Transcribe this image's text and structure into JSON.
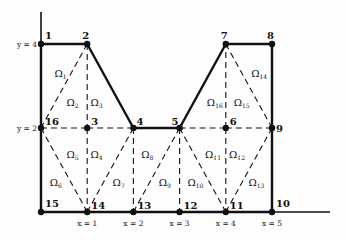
{
  "diagram": {
    "type": "finite-element-mesh",
    "scale": {
      "x0_px": 41,
      "x_unit_px": 46.2,
      "y0_px": 212,
      "y_unit_px": 42
    },
    "axes": {
      "x_ticks": [
        {
          "x": 1,
          "label": "x = 1"
        },
        {
          "x": 2,
          "label": "x = 2"
        },
        {
          "x": 3,
          "label": "x = 3"
        },
        {
          "x": 4,
          "label": "x = 4"
        },
        {
          "x": 5,
          "label": "x = 5"
        }
      ],
      "y_ticks": [
        {
          "y": 4,
          "label": "y = 4"
        },
        {
          "y": 2,
          "label": "y = 2"
        }
      ]
    },
    "nodes": [
      {
        "id": "1",
        "x": 0,
        "y": 4
      },
      {
        "id": "2",
        "x": 1,
        "y": 4
      },
      {
        "id": "3",
        "x": 1,
        "y": 2
      },
      {
        "id": "4",
        "x": 2,
        "y": 2
      },
      {
        "id": "5",
        "x": 3,
        "y": 2
      },
      {
        "id": "6",
        "x": 4,
        "y": 2
      },
      {
        "id": "7",
        "x": 4,
        "y": 4
      },
      {
        "id": "8",
        "x": 5,
        "y": 4
      },
      {
        "id": "9",
        "x": 5,
        "y": 2
      },
      {
        "id": "10",
        "x": 5,
        "y": 0
      },
      {
        "id": "11",
        "x": 4,
        "y": 0
      },
      {
        "id": "12",
        "x": 3,
        "y": 0
      },
      {
        "id": "13",
        "x": 2,
        "y": 0
      },
      {
        "id": "14",
        "x": 1,
        "y": 0
      },
      {
        "id": "15",
        "x": 0,
        "y": 0
      },
      {
        "id": "16",
        "x": 0,
        "y": 2
      }
    ],
    "boundary_edges": [
      [
        "1",
        "2"
      ],
      [
        "2",
        "4"
      ],
      [
        "4",
        "5"
      ],
      [
        "5",
        "7"
      ],
      [
        "7",
        "8"
      ],
      [
        "8",
        "9"
      ],
      [
        "9",
        "10"
      ],
      [
        "10",
        "11"
      ],
      [
        "11",
        "12"
      ],
      [
        "12",
        "13"
      ],
      [
        "13",
        "14"
      ],
      [
        "14",
        "15"
      ],
      [
        "15",
        "16"
      ],
      [
        "16",
        "1"
      ]
    ],
    "interior_edges": [
      [
        "2",
        "16"
      ],
      [
        "2",
        "3"
      ],
      [
        "16",
        "3"
      ],
      [
        "3",
        "4"
      ],
      [
        "3",
        "14"
      ],
      [
        "16",
        "14"
      ],
      [
        "4",
        "14"
      ],
      [
        "4",
        "13"
      ],
      [
        "5",
        "13"
      ],
      [
        "5",
        "12"
      ],
      [
        "5",
        "11"
      ],
      [
        "5",
        "6"
      ],
      [
        "6",
        "9"
      ],
      [
        "6",
        "11"
      ],
      [
        "9",
        "11"
      ],
      [
        "6",
        "7"
      ],
      [
        "7",
        "9"
      ]
    ],
    "elements": [
      {
        "name": "Ω",
        "sub": "1",
        "x": 0.42,
        "y": 3.3
      },
      {
        "name": "Ω",
        "sub": "2",
        "x": 0.68,
        "y": 2.62
      },
      {
        "name": "Ω",
        "sub": "3",
        "x": 1.2,
        "y": 2.62
      },
      {
        "name": "Ω",
        "sub": "4",
        "x": 1.2,
        "y": 1.38
      },
      {
        "name": "Ω",
        "sub": "5",
        "x": 0.68,
        "y": 1.38
      },
      {
        "name": "Ω",
        "sub": "6",
        "x": 0.32,
        "y": 0.72
      },
      {
        "name": "Ω",
        "sub": "7",
        "x": 1.68,
        "y": 0.72
      },
      {
        "name": "Ω",
        "sub": "8",
        "x": 2.3,
        "y": 1.38
      },
      {
        "name": "Ω",
        "sub": "9",
        "x": 2.68,
        "y": 0.72
      },
      {
        "name": "Ω",
        "sub": "10",
        "x": 3.3,
        "y": 0.72
      },
      {
        "name": "Ω",
        "sub": "11",
        "x": 3.68,
        "y": 1.38
      },
      {
        "name": "Ω",
        "sub": "12",
        "x": 4.2,
        "y": 1.38
      },
      {
        "name": "Ω",
        "sub": "13",
        "x": 4.62,
        "y": 0.72
      },
      {
        "name": "Ω",
        "sub": "14",
        "x": 4.68,
        "y": 3.3
      },
      {
        "name": "Ω",
        "sub": "15",
        "x": 4.3,
        "y": 2.62
      },
      {
        "name": "Ω",
        "sub": "16",
        "x": 3.72,
        "y": 2.62
      }
    ],
    "node_label_offsets": {
      "1": [
        4,
        -5
      ],
      "2": [
        -5,
        -5
      ],
      "3": [
        4,
        -3
      ],
      "4": [
        3,
        -3
      ],
      "5": [
        -8,
        -3
      ],
      "6": [
        4,
        -3
      ],
      "7": [
        -5,
        -5
      ],
      "8": [
        -5,
        -5
      ],
      "9": [
        4,
        4
      ],
      "10": [
        4,
        -5
      ],
      "11": [
        4,
        -3
      ],
      "12": [
        4,
        -3
      ],
      "13": [
        4,
        -3
      ],
      "14": [
        4,
        -3
      ],
      "15": [
        4,
        -5
      ],
      "16": [
        4,
        -3
      ]
    }
  }
}
